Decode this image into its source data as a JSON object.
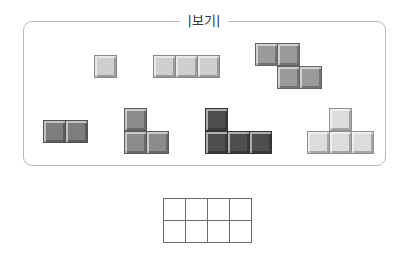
{
  "legend": {
    "label": "|보기|"
  },
  "pieces": [
    {
      "name": "monomino",
      "color": "#cfcfcf",
      "cells": [
        [
          94,
          55
        ]
      ]
    },
    {
      "name": "i-tromino",
      "color": "#cfcfcf",
      "cells": [
        [
          153,
          55
        ],
        [
          175,
          55
        ],
        [
          197,
          55
        ]
      ]
    },
    {
      "name": "s-tetromino",
      "color": "#9a9a9a",
      "cells": [
        [
          255,
          43
        ],
        [
          277,
          43
        ],
        [
          277,
          66
        ],
        [
          299,
          66
        ]
      ]
    },
    {
      "name": "domino",
      "color": "#7d7d7d",
      "cells": [
        [
          43,
          120
        ],
        [
          65,
          120
        ]
      ]
    },
    {
      "name": "l-tromino",
      "color": "#8c8c8c",
      "cells": [
        [
          124,
          108
        ],
        [
          124,
          131
        ],
        [
          146,
          131
        ]
      ]
    },
    {
      "name": "l-tetromino",
      "color": "#4e4e4e",
      "cells": [
        [
          205,
          108
        ],
        [
          205,
          131
        ],
        [
          227,
          131
        ],
        [
          249,
          131
        ]
      ]
    },
    {
      "name": "t-tetromino",
      "color": "#dcdcdc",
      "cells": [
        [
          329,
          108
        ],
        [
          307,
          131
        ],
        [
          329,
          131
        ],
        [
          351,
          131
        ]
      ]
    }
  ],
  "tile_size": 23,
  "grid": {
    "rows": 2,
    "cols": 4
  }
}
